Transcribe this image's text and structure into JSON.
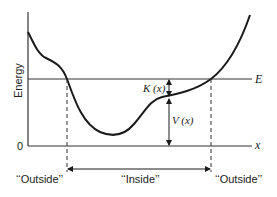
{
  "diagram": {
    "type": "potential-energy-well",
    "y_axis_label": "Energy",
    "origin_label": "0",
    "x_axis_label": "x",
    "energy_line_label": "E",
    "kinetic_label": "K (x)",
    "potential_label": "V (x)",
    "regions": [
      {
        "label": "‘‘Outside’’"
      },
      {
        "label": "‘‘Inside’’"
      },
      {
        "label": "‘‘Outside’’"
      }
    ],
    "colors": {
      "line": "#1a1a1a",
      "axis": "#333333",
      "background": "#ffffff"
    }
  }
}
